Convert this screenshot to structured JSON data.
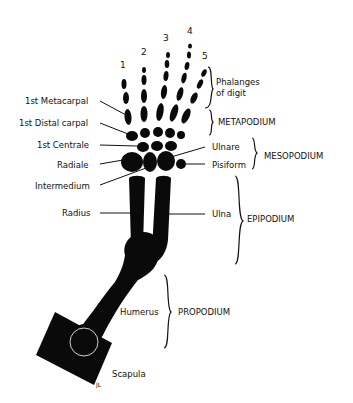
{
  "diagram": {
    "digit_numbers": [
      "1",
      "2",
      "3",
      "4",
      "5"
    ],
    "left_labels": {
      "first_metacarpal": "1st Metacarpal",
      "first_distal_carpal": "1st Distal carpal",
      "first_centrale": "1st Centrale",
      "radiale": "Radiale",
      "intermedium": "Intermedium",
      "radius": "Radius"
    },
    "right_labels": {
      "phalanges_line1": "Phalanges",
      "phalanges_line2": "of digit",
      "ulnare": "Ulnare",
      "pisiform": "Pisiform",
      "ulna": "Ulna",
      "humerus": "Humerus",
      "scapula": "Scapula"
    },
    "regions": {
      "metapodium": "METAPODIUM",
      "mesopodium": "MESOPODIUM",
      "epipodium": "EPIPODIUM",
      "propodium": "PROPODIUM"
    },
    "signature": "JL",
    "colors": {
      "bone": "#0a0a0a",
      "background": "#ffffff",
      "text": "#111111"
    }
  }
}
